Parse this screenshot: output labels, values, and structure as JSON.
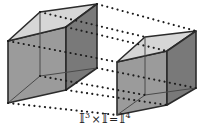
{
  "figure": {
    "caption": {
      "full": "I³ × I = I⁴",
      "term1_base": "𝕀",
      "term1_exp": "3",
      "operator_times": "×",
      "term2_base": "𝕀",
      "operator_equals": "=",
      "term3_base": "𝕀",
      "term3_exp": "4"
    },
    "colors": {
      "background": "#ffffff",
      "top_face": "#d6d6d6",
      "left_face": "#9b9b9b",
      "right_face": "#797979",
      "hidden_face": "#8e8e8e",
      "edge_stroke": "#2b2b2b",
      "inner_edge_stroke": "#4a4a4a",
      "dot_color": "#1c1c1c",
      "caption_color": "#222222"
    },
    "objects": [
      {
        "name": "left-cube",
        "label": "I^3 cube (left)",
        "front_quad": [
          [
            8,
            41
          ],
          [
            66,
            27
          ],
          [
            66,
            90
          ],
          [
            8,
            103
          ]
        ],
        "top_quad": [
          [
            8,
            41
          ],
          [
            40,
            12
          ],
          [
            97,
            4
          ],
          [
            66,
            27
          ]
        ],
        "right_quad": [
          [
            66,
            27
          ],
          [
            97,
            4
          ],
          [
            97,
            68
          ],
          [
            66,
            90
          ]
        ],
        "hidden_vertex": [
          40,
          76
        ]
      },
      {
        "name": "right-cube",
        "label": "I^3 cube (right)",
        "front_quad": [
          [
            117,
            62
          ],
          [
            167,
            51
          ],
          [
            167,
            105
          ],
          [
            117,
            115
          ]
        ],
        "top_quad": [
          [
            117,
            62
          ],
          [
            145,
            37
          ],
          [
            196,
            31
          ],
          [
            167,
            51
          ]
        ],
        "right_quad": [
          [
            167,
            51
          ],
          [
            196,
            31
          ],
          [
            196,
            88
          ],
          [
            167,
            105
          ]
        ],
        "hidden_vertex": [
          145,
          95
        ]
      }
    ],
    "connectors": {
      "name": "dotted-connection-lines",
      "style": "dotted",
      "count": 8,
      "lines": [
        [
          [
            97,
            4
          ],
          [
            196,
            31
          ]
        ],
        [
          [
            66,
            27
          ],
          [
            167,
            51
          ]
        ],
        [
          [
            40,
            12
          ],
          [
            145,
            37
          ]
        ],
        [
          [
            8,
            41
          ],
          [
            117,
            62
          ]
        ],
        [
          [
            97,
            68
          ],
          [
            196,
            88
          ]
        ],
        [
          [
            66,
            90
          ],
          [
            167,
            105
          ]
        ],
        [
          [
            40,
            76
          ],
          [
            145,
            95
          ]
        ],
        [
          [
            8,
            103
          ],
          [
            117,
            115
          ]
        ]
      ]
    }
  }
}
